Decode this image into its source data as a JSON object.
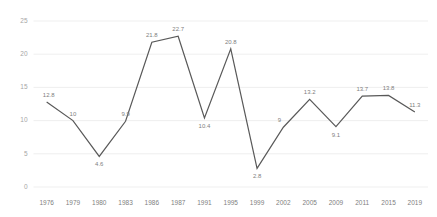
{
  "chart_data": {
    "type": "line",
    "title": "",
    "subtitle": "",
    "xlabel": "",
    "ylabel": "",
    "categories": [
      "1976",
      "1979",
      "1980",
      "1983",
      "1986",
      "1987",
      "1991",
      "1995",
      "1999",
      "2002",
      "2005",
      "2009",
      "2011",
      "2015",
      "2019"
    ],
    "values": [
      12.8,
      10,
      4.6,
      9.9,
      21.8,
      22.7,
      10.4,
      20.8,
      2.8,
      9,
      13.2,
      9.1,
      13.7,
      13.8,
      11.3
    ],
    "point_labels": [
      "12.8",
      "10",
      "4.6",
      "9.9",
      "21.8",
      "22.7",
      "10.4",
      "20.8",
      "2.8",
      "9",
      "13.2",
      "9.1",
      "13.7",
      "13.8",
      "11.3"
    ],
    "series": [
      {
        "name": "",
        "values": [
          12.8,
          10,
          4.6,
          9.9,
          21.8,
          22.7,
          10.4,
          20.8,
          2.8,
          9,
          13.2,
          9.1,
          13.7,
          13.8,
          11.3
        ]
      }
    ],
    "ylim": [
      0,
      25
    ],
    "yticks": [
      0,
      5,
      10,
      15,
      20,
      25
    ],
    "ytick_labels": [
      "0",
      "5",
      "10",
      "15",
      "20",
      "25"
    ],
    "grid": true,
    "grid_axis": "y",
    "legend": false,
    "legend_position": "none",
    "colors": {
      "line": "#595959",
      "grid": "#e8e8e8",
      "ytick_text": "#a6a6a6",
      "xtick_text": "#808080",
      "point_label_text": "#808080",
      "background": "#ffffff"
    }
  }
}
